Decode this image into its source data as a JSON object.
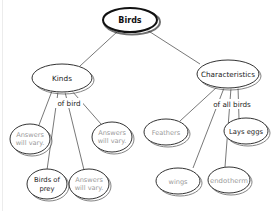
{
  "diagram": {
    "type": "concept-map",
    "root": {
      "label": "Birds"
    },
    "branches": [
      {
        "label": "Kinds",
        "link_label": "of bird",
        "children": [
          {
            "line1": "Answers",
            "line2": "will vary.",
            "style": "placeholder"
          },
          {
            "line1": "Answers",
            "line2": "will vary.",
            "style": "placeholder"
          },
          {
            "line1": "Birds of",
            "line2": "prey",
            "style": "answer"
          },
          {
            "line1": "Answers",
            "line2": "will vary.",
            "style": "placeholder"
          }
        ]
      },
      {
        "label": "Characteristics",
        "link_label": "of all birds",
        "children": [
          {
            "label": "Feathers",
            "style": "placeholder"
          },
          {
            "label": "Lays eggs",
            "style": "answer"
          },
          {
            "label": "wings",
            "style": "placeholder"
          },
          {
            "label": "endotherm",
            "style": "placeholder"
          }
        ]
      }
    ]
  }
}
